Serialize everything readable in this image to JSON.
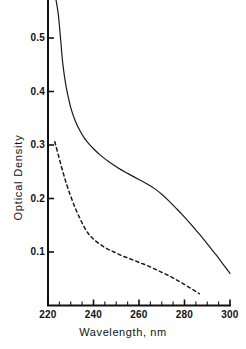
{
  "chart_data": {
    "type": "line",
    "title": "",
    "subtitle": "",
    "xlabel": "Wavelength, nm",
    "ylabel": "Optical Density",
    "xlim": [
      220,
      302
    ],
    "ylim": [
      0.0,
      0.56
    ],
    "grid": false,
    "legend": "none",
    "xticks": [
      220,
      240,
      260,
      280,
      300
    ],
    "xtick_labels": [
      "220",
      "240",
      "260",
      "280",
      "300"
    ],
    "xminor_step": 5,
    "yticks": [
      0.1,
      0.2,
      0.3,
      0.4,
      0.5
    ],
    "ytick_labels": [
      "0.1",
      "0.2",
      "0.3",
      "0.4",
      "0.5"
    ],
    "series": [
      {
        "name": "solid-curve",
        "style": "solid",
        "color": "#1a1a1a",
        "x": [
          223.5,
          224.5,
          225.5,
          226.5,
          228,
          230,
          232,
          234,
          236,
          238,
          240,
          243,
          246,
          249,
          252,
          255,
          258,
          261,
          264,
          267,
          270,
          273,
          276,
          279,
          282,
          285,
          288,
          291,
          294,
          297,
          300
        ],
        "y": [
          0.572,
          0.545,
          0.5,
          0.452,
          0.408,
          0.37,
          0.345,
          0.327,
          0.313,
          0.302,
          0.293,
          0.281,
          0.271,
          0.262,
          0.254,
          0.247,
          0.24,
          0.233,
          0.226,
          0.218,
          0.208,
          0.196,
          0.183,
          0.17,
          0.156,
          0.141,
          0.126,
          0.11,
          0.094,
          0.077,
          0.06
        ]
      },
      {
        "name": "dashed-curve",
        "style": "dashed",
        "color": "#1a1a1a",
        "x": [
          223,
          224,
          226,
          228,
          230,
          232,
          234,
          236,
          238,
          240,
          243,
          246,
          249,
          252,
          255,
          258,
          261,
          264,
          267,
          270,
          273,
          276,
          279,
          282,
          285,
          286.5
        ],
        "y": [
          0.306,
          0.29,
          0.258,
          0.229,
          0.204,
          0.182,
          0.163,
          0.146,
          0.133,
          0.124,
          0.114,
          0.106,
          0.1,
          0.094,
          0.089,
          0.084,
          0.079,
          0.074,
          0.068,
          0.062,
          0.056,
          0.049,
          0.042,
          0.034,
          0.026,
          0.022
        ]
      }
    ]
  },
  "axes": {
    "x_title": "Wavelength, nm",
    "y_title": "Optical Density"
  }
}
